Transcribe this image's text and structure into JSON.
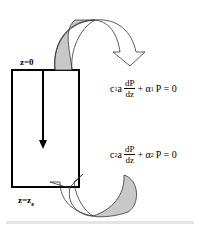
{
  "labels": {
    "top": "z=0",
    "bottom": "z=z",
    "bottom_sub": "e"
  },
  "equations": {
    "top": {
      "coef": "c",
      "coef_sub": "1",
      "a": "a",
      "num": "dP",
      "den": "dz",
      "plus": "+ α",
      "alpha_sub": "1",
      "rhs": "P = 0"
    },
    "bottom": {
      "coef": "c",
      "coef_sub": "2",
      "a": "a",
      "num": "dP",
      "den": "dz",
      "plus": "+ α",
      "alpha_sub": "2",
      "rhs": "P = 0"
    }
  },
  "colors": {
    "arrow_fill": "#c8c8c8",
    "stroke": "#000000"
  }
}
